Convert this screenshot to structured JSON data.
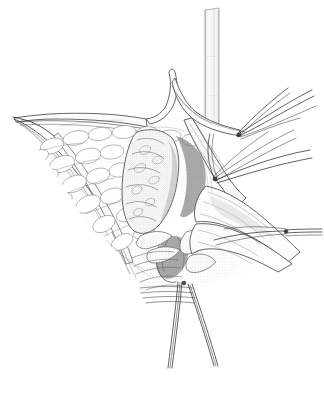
{
  "figure": {
    "medium": "pen-and-ink stipple line illustration",
    "background_color": "#ffffff",
    "ink_color": "#3a3a3a",
    "width": 324,
    "height": 393,
    "caption": "",
    "labels": []
  },
  "structures": [
    {
      "id": "tracheal-tube",
      "name": "Tracheal cannula / tube",
      "note": "vertical tube entering wound from above",
      "color": "#f4f4f4"
    },
    {
      "id": "superior-flap",
      "name": "Superior skin and platysma flap",
      "note": "retracted upward, peaked at center"
    },
    {
      "id": "left-wound-edge",
      "name": "Left wound apex",
      "note": "converging retracted edges, sharp apex at left"
    },
    {
      "id": "subcutaneous-fat",
      "name": "Subcutaneous fat lobules",
      "note": "lobular stippled texture filling upper left field"
    },
    {
      "id": "thyroid-lobe",
      "name": "Thyroid lobe",
      "note": "central ovoid lobulated gland"
    },
    {
      "id": "strap-muscle",
      "name": "Strap muscle bundle",
      "note": "retracted band crossing obliquely to lower right"
    },
    {
      "id": "deep-incision",
      "name": "Deep incision / tracheal opening",
      "note": "dark shaded aperture at lower center"
    },
    {
      "id": "right-flap",
      "name": "Right tissue flap",
      "note": "retracted laterally to right apex"
    },
    {
      "id": "suture-upper-right",
      "name": "Upper right suture bundle",
      "note": "fan of strands exiting upper right"
    },
    {
      "id": "suture-mid-right",
      "name": "Mid right suture bundle",
      "note": "strands from knot toward right margin"
    },
    {
      "id": "suture-right-apex",
      "name": "Right apex traction sutures",
      "note": "horizontal strands at right margin"
    },
    {
      "id": "suture-inferior",
      "name": "Inferior traction sutures",
      "note": "two paired strands descending below wound"
    },
    {
      "id": "knot-upper",
      "name": "Upper suture knot"
    },
    {
      "id": "knot-mid",
      "name": "Mid suture knot"
    },
    {
      "id": "knot-inferior",
      "name": "Inferior suture knot"
    }
  ],
  "palette": {
    "paper": "#ffffff",
    "line": "#3a3a3a",
    "stipple": "#777777",
    "deep_shadow": "#6e6e6e",
    "mid_shadow": "#9b9b9b",
    "tube_fill": "#f4f4f4"
  }
}
